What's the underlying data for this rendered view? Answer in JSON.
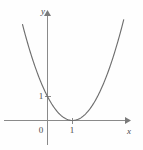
{
  "figure": {
    "title": "",
    "background_color": "#fefefe",
    "curve_color": "#6e6e6e",
    "axis_color": "#8a8a8a",
    "label_color": "#4a4a4a"
  },
  "axes": {
    "x_axis_label": "x",
    "y_axis_label": "y",
    "origin_label": "0",
    "x_ticks": [
      {
        "value": 1,
        "label": "1"
      }
    ],
    "y_ticks": [
      {
        "value": 1,
        "label": "1"
      }
    ],
    "xlim": [
      -1.0,
      3.3
    ],
    "ylim": [
      -0.3,
      4.2
    ],
    "grid": false
  },
  "chart_data": {
    "type": "line",
    "title": "",
    "xlabel": "x",
    "ylabel": "y",
    "xlim": [
      -1.0,
      3.3
    ],
    "ylim": [
      -0.3,
      4.2
    ],
    "grid": false,
    "legend": null,
    "series": [
      {
        "name": "y = (x - 1)^2",
        "equation": "y = (x - 1)^2",
        "vertex": [
          1,
          0
        ],
        "y_intercept": [
          0,
          1
        ],
        "x": [
          -0.95,
          -0.8,
          -0.6,
          -0.4,
          -0.2,
          0.0,
          0.2,
          0.4,
          0.6,
          0.8,
          1.0,
          1.2,
          1.4,
          1.6,
          1.8,
          2.0,
          2.2,
          2.4,
          2.6,
          2.8,
          2.95
        ],
        "values": [
          3.8025,
          3.24,
          2.56,
          1.96,
          1.44,
          1.0,
          0.64,
          0.36,
          0.16,
          0.04,
          0.0,
          0.04,
          0.16,
          0.36,
          0.64,
          1.0,
          1.44,
          1.96,
          2.56,
          3.24,
          3.8025
        ]
      }
    ],
    "annotations": [
      {
        "text": "0",
        "x": -0.1,
        "y": -0.33,
        "role": "origin-label"
      },
      {
        "text": "1",
        "x": 1.0,
        "y": -0.33,
        "role": "x-tick-label"
      },
      {
        "text": "1",
        "x": -0.16,
        "y": 1.0,
        "role": "y-tick-label"
      },
      {
        "text": "x",
        "x": 3.25,
        "y": -0.4,
        "role": "x-axis-name"
      },
      {
        "text": "y",
        "x": -0.17,
        "y": 4.2,
        "role": "y-axis-name"
      }
    ]
  }
}
